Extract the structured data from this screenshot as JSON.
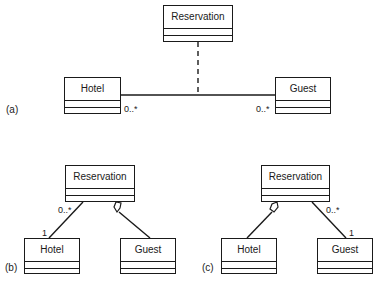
{
  "panels": [
    {
      "id": "a",
      "label": "(a)",
      "classes": {
        "reservation": "Reservation",
        "hotel": "Hotel",
        "guest": "Guest"
      },
      "multiplicities": {
        "hotel_end": "0..*",
        "guest_end": "0..*"
      },
      "relation": "association class"
    },
    {
      "id": "b",
      "label": "(b)",
      "classes": {
        "reservation": "Reservation",
        "hotel": "Hotel",
        "guest": "Guest"
      },
      "multiplicities": {
        "reservation_end": "0..*",
        "hotel_end": "1"
      },
      "relation": "aggregation Reservation-Guest"
    },
    {
      "id": "c",
      "label": "(c)",
      "classes": {
        "reservation": "Reservation",
        "hotel": "Hotel",
        "guest": "Guest"
      },
      "multiplicities": {
        "reservation_end": "0..*",
        "guest_end": "1"
      },
      "relation": "aggregation Reservation-Hotel"
    }
  ],
  "colors": {
    "stroke": "#1a1a1a",
    "background": "#ffffff"
  }
}
